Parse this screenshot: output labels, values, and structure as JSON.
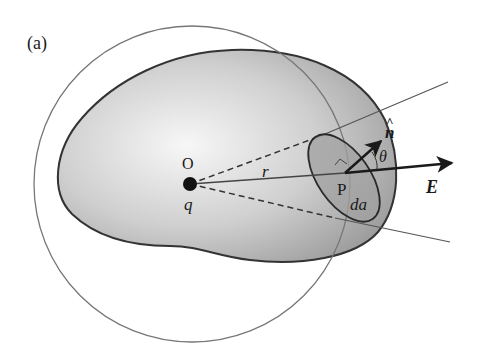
{
  "figure": {
    "panel_label": "(a)",
    "labels": {
      "origin": "O",
      "charge": "q",
      "distance": "r",
      "point": "P",
      "area_element": "da",
      "normal": "n",
      "normal_hat": "^",
      "angle": "θ",
      "field": "E"
    },
    "colors": {
      "outline": "#333333",
      "circle": "#777777",
      "fill_light": "#f4f4f4",
      "fill_dark": "#a9a9a9",
      "patch_fill": "#a0a0a0",
      "arrow": "#1a1a1a"
    }
  }
}
